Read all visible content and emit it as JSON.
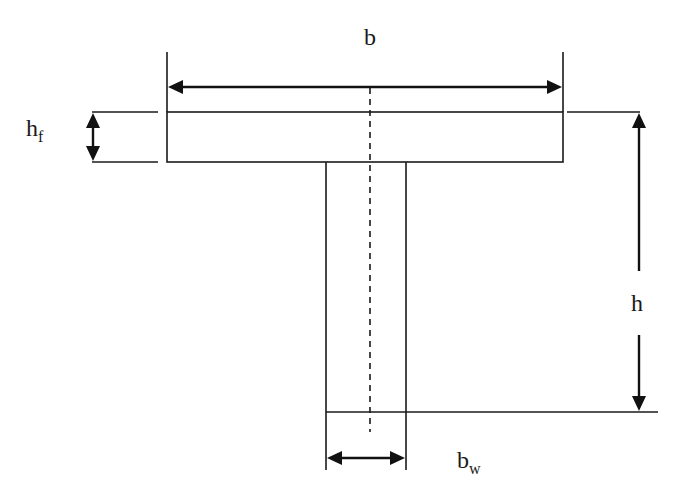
{
  "diagram": {
    "type": "T-beam cross-section",
    "labels": {
      "flange_width": {
        "main": "b",
        "sub": ""
      },
      "flange_thickness": {
        "main": "h",
        "sub": "f"
      },
      "total_height": {
        "main": "h",
        "sub": ""
      },
      "web_width": {
        "main": "b",
        "sub": "w"
      }
    },
    "colors": {
      "stroke": "#1a1a1a",
      "background": "#ffffff"
    }
  }
}
